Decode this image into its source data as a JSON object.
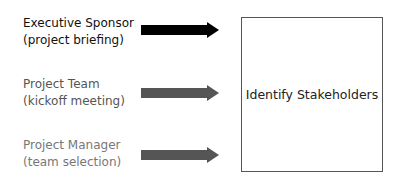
{
  "inputs": [
    {
      "line1": "Executive Sponsor",
      "line2": "(project briefing)",
      "text_color": "#111111",
      "arrow_color": "#000000"
    },
    {
      "line1": "Project Team",
      "line2": "(kickoff meeting)",
      "text_color": "#555555",
      "arrow_color": "#555555"
    },
    {
      "line1": "Project Manager",
      "line2": "(team selection)",
      "text_color": "#777777",
      "arrow_color": "#555555"
    }
  ],
  "process": {
    "label": "Identify Stakeholders"
  }
}
